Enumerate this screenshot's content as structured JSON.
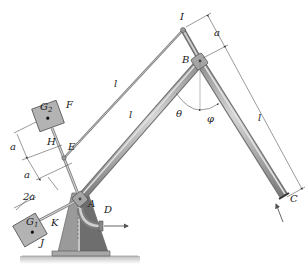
{
  "figure": {
    "type": "mechanism-diagram",
    "labels": {
      "I": "I",
      "B": "B",
      "A": "A",
      "C": "C",
      "D": "D",
      "E": "E",
      "F": "F",
      "H": "H",
      "J": "J",
      "K": "K",
      "G1": "G",
      "G1_sub": "1",
      "G2": "G",
      "G2_sub": "2",
      "theta": "θ",
      "phi": "φ"
    },
    "dimensions": {
      "upper_rod_length": "l",
      "main_arm_length": "l",
      "rod_BC_length": "l",
      "offset_IB": "a",
      "offset_HE_upper": "a",
      "offset_HE_lower": "a",
      "offset_AK": "2a"
    },
    "colors": {
      "rod_fill": "#a9a9a9",
      "rod_highlight": "#d4d4d4",
      "block_fill": "#b3b3b3",
      "base_light": "#9a9a9a",
      "base_dark": "#6e6e6e",
      "ground": "#cfcfcf",
      "dimension_line": "#555555"
    }
  }
}
